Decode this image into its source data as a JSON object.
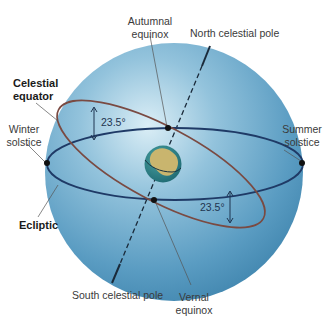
{
  "diagram": {
    "labels": {
      "autumnal_equinox": [
        "Autumnal",
        "equinox"
      ],
      "north_celestial_pole": "North celestial pole",
      "celestial_equator": [
        "Celestial",
        "equator"
      ],
      "winter_solstice": [
        "Winter",
        "solstice"
      ],
      "summer_solstice": [
        "Summer",
        "solstice"
      ],
      "ecliptic": "Ecliptic",
      "south_celestial_pole": "South celestial pole",
      "vernal_equinox": [
        "Vernal",
        "equinox"
      ]
    },
    "angles": {
      "upper_tilt": "23.5°",
      "lower_tilt": "23.5°"
    },
    "colors": {
      "sphere_light": "#cfe4f0",
      "sphere_mid": "#6aa8c8",
      "sphere_dark": "#3f86ae",
      "celestial_equator": "#1f3a66",
      "ecliptic": "#7a4a42",
      "axis": "#1a2a3a",
      "earth_ocean": "#2f7f86",
      "earth_land": "#c9b56e",
      "point": "#111111"
    }
  }
}
